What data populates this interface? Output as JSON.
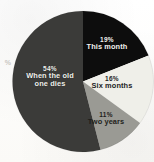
{
  "figure": {
    "background_color": "#fdfdfb",
    "edge_fragment_text": "%"
  },
  "chart_data": {
    "type": "pie",
    "title": "",
    "subtitle": "",
    "xlabel": "",
    "ylabel": "",
    "legend_position": "none",
    "grid": false,
    "labels_inside_slices": true,
    "start_angle_deg": 0,
    "direction": "clockwise",
    "categories": [
      "This month",
      "Six months",
      "Two years",
      "When the old one dies"
    ],
    "values": [
      19,
      16,
      11,
      54
    ],
    "value_unit": "%",
    "slices": [
      {
        "label": "This month",
        "value": 19,
        "value_text": "19%",
        "color": "#0d0d0d",
        "text_color": "#f2f2ef"
      },
      {
        "label": "Six months",
        "value": 16,
        "value_text": "16%",
        "color": "#efefe9",
        "text_color": "#23231f"
      },
      {
        "label": "Two years",
        "value": 11,
        "value_text": "11%",
        "color": "#9a9a94",
        "text_color": "#1e1e1b"
      },
      {
        "label": "When the old one dies",
        "value": 54,
        "value_text": "54%",
        "color": "#3b3b39",
        "text_color": "#f0f0ec"
      }
    ]
  },
  "labels": {
    "this_month": {
      "pct": "19%",
      "name": "This month"
    },
    "six_months": {
      "pct": "16%",
      "name": "Six months"
    },
    "two_years": {
      "pct": "11%",
      "name": "Two years"
    },
    "when_old_dies": {
      "pct": "54%",
      "name_line1": "When the old",
      "name_line2": "one dies"
    }
  }
}
